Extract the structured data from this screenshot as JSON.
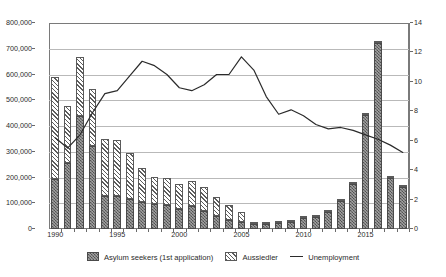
{
  "chart_data": {
    "type": "bar",
    "title": "",
    "subtitle": "",
    "xlabel": "",
    "ylabel": "",
    "y2label": "",
    "grid": true,
    "legend_position": "bottom",
    "categories": [
      1990,
      1991,
      1992,
      1993,
      1994,
      1995,
      1996,
      1997,
      1998,
      1999,
      2000,
      2001,
      2002,
      2003,
      2004,
      2005,
      2006,
      2007,
      2008,
      2009,
      2010,
      2011,
      2012,
      2013,
      2014,
      2015,
      2016,
      2017,
      2018
    ],
    "xtick_labels": [
      "1990",
      "1995",
      "2000",
      "2005",
      "2010",
      "2015"
    ],
    "ylim": [
      0,
      800000
    ],
    "yticks": [
      0,
      100000,
      200000,
      300000,
      400000,
      500000,
      600000,
      700000,
      800000
    ],
    "ytick_labels": [
      "0",
      "100,000",
      "200,000",
      "300,000",
      "400,000",
      "500,000",
      "600,000",
      "700,000",
      "800,000"
    ],
    "y2lim": [
      0,
      14
    ],
    "y2ticks": [
      0,
      2,
      4,
      6,
      8,
      10,
      12,
      14
    ],
    "y2tick_labels": [
      "0",
      "2",
      "4",
      "6",
      "8",
      "10",
      "12",
      "14"
    ],
    "series": [
      {
        "name": "Asylum seekers (1st application)",
        "type": "bar",
        "stack": "immigration",
        "axis": "left",
        "color": "#6e6e6e",
        "pattern": "checker",
        "values": [
          193000,
          256000,
          438000,
          323000,
          127000,
          128000,
          116000,
          104000,
          98600,
          95100,
          78600,
          88300,
          71100,
          50600,
          35600,
          28900,
          21000,
          19200,
          22100,
          27600,
          41300,
          45700,
          64500,
          109600,
          173000,
          442000,
          722000,
          198000,
          162000
        ]
      },
      {
        "name": "Aussiedler",
        "type": "bar",
        "stack": "immigration",
        "axis": "left",
        "color": "#f2f2f2",
        "pattern": "diagonal-hatch",
        "values": [
          397000,
          222000,
          231000,
          219000,
          222000,
          218000,
          178000,
          134000,
          103000,
          104000,
          96000,
          98000,
          91000,
          73000,
          59000,
          36000,
          8000,
          6000,
          4500,
          3400,
          2300,
          2100,
          1800,
          2400,
          5600,
          6000,
          6600,
          7000,
          7100
        ]
      },
      {
        "name": "Unemployment",
        "type": "line",
        "axis": "right",
        "color": "#2b2b2b",
        "unit": "%",
        "values": [
          6.2,
          5.5,
          6.4,
          7.9,
          9.2,
          9.4,
          10.4,
          11.4,
          11.1,
          10.5,
          9.6,
          9.4,
          9.8,
          10.5,
          10.5,
          11.7,
          10.8,
          9.0,
          7.8,
          8.1,
          7.7,
          7.1,
          6.8,
          6.9,
          6.7,
          6.4,
          6.1,
          5.7,
          5.2
        ]
      }
    ]
  },
  "legend": {
    "items": [
      {
        "label": "Asylum seekers (1st application)",
        "marker": "bar-checker-swatch"
      },
      {
        "label": "Aussiedler",
        "marker": "bar-hatch-swatch"
      },
      {
        "label": "Unemployment",
        "marker": "line-swatch"
      }
    ]
  },
  "colors": {
    "asylum": "#6e6e6e",
    "aussiedler": "#f2f2f2",
    "unemployment": "#2b2b2b",
    "grid": "#b9b9b9",
    "axis": "#7a7a7a",
    "text": "#2b2b2b",
    "background": "#ffffff"
  }
}
